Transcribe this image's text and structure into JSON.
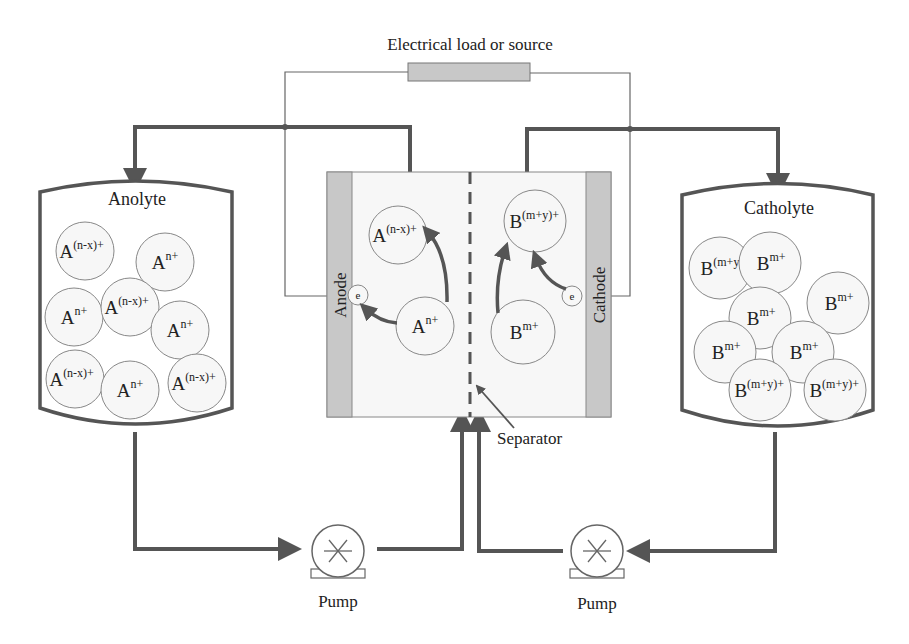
{
  "title": "Electrical load or source",
  "tanks": {
    "anolyte": {
      "label": "Anolyte",
      "ions": [
        {
          "base": "A",
          "sup": "(n-x)+",
          "cx": 85,
          "cy": 251,
          "r": 29
        },
        {
          "base": "A",
          "sup": "n+",
          "cx": 165,
          "cy": 262,
          "r": 29
        },
        {
          "base": "A",
          "sup": "n+",
          "cx": 74,
          "cy": 317,
          "r": 29
        },
        {
          "base": "A",
          "sup": "(n-x)+",
          "cx": 130,
          "cy": 307,
          "r": 29
        },
        {
          "base": "A",
          "sup": "n+",
          "cx": 180,
          "cy": 330,
          "r": 29
        },
        {
          "base": "A",
          "sup": "(n-x)+",
          "cx": 75,
          "cy": 379,
          "r": 29
        },
        {
          "base": "A",
          "sup": "n+",
          "cx": 130,
          "cy": 390,
          "r": 29
        },
        {
          "base": "A",
          "sup": "(n-x)+",
          "cx": 197,
          "cy": 383,
          "r": 29
        }
      ]
    },
    "catholyte": {
      "label": "Catholyte",
      "ions": [
        {
          "base": "B",
          "sup": "(m+y",
          "cx": 720,
          "cy": 268,
          "r": 31
        },
        {
          "base": "B",
          "sup": "m+",
          "cx": 770,
          "cy": 263,
          "r": 31
        },
        {
          "base": "B",
          "sup": "m+",
          "cx": 838,
          "cy": 303,
          "r": 31
        },
        {
          "base": "B",
          "sup": "m+",
          "cx": 760,
          "cy": 318,
          "r": 31
        },
        {
          "base": "B",
          "sup": "m+",
          "cx": 725,
          "cy": 352,
          "r": 31
        },
        {
          "base": "B",
          "sup": "m+",
          "cx": 803,
          "cy": 352,
          "r": 31
        },
        {
          "base": "B",
          "sup": "(m+y)+",
          "cx": 760,
          "cy": 390,
          "r": 31
        },
        {
          "base": "B",
          "sup": "(m+y)+",
          "cx": 835,
          "cy": 390,
          "r": 31
        }
      ]
    }
  },
  "cell": {
    "anode_label": "Anode",
    "cathode_label": "Cathode",
    "separator_label": "Separator",
    "electron_label": "e",
    "ions": [
      {
        "base": "A",
        "sup": "(n-x)+",
        "cx": 398,
        "cy": 235,
        "r": 29
      },
      {
        "base": "A",
        "sup": "n+",
        "cx": 425,
        "cy": 326,
        "r": 29
      },
      {
        "base": "B",
        "sup": "(m+y)+",
        "cx": 535,
        "cy": 221,
        "r": 31
      },
      {
        "base": "B",
        "sup": "m+",
        "cx": 523,
        "cy": 332,
        "r": 32
      }
    ]
  },
  "pumps": [
    {
      "label": "Pump",
      "cx": 338,
      "cy": 551
    },
    {
      "label": "Pump",
      "cx": 597,
      "cy": 551
    }
  ],
  "colors": {
    "pipe": "#555555",
    "wire": "#666666",
    "electrode": "#c8c8c8",
    "load": "#c8c8c8",
    "cell_fill": "#f7f7f7",
    "ion_fill": "#f7f7f7",
    "ion_stroke": "#888888"
  }
}
